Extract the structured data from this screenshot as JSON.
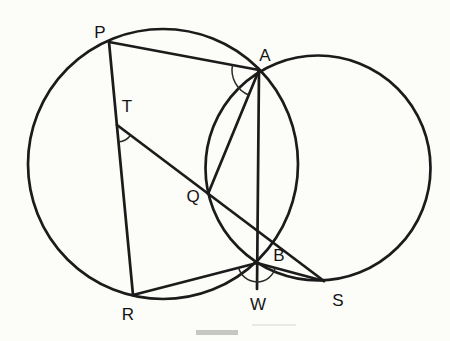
{
  "figure": {
    "points": {
      "P": "P",
      "A": "A",
      "T": "T",
      "Q": "Q",
      "B": "B",
      "R": "R",
      "W": "W",
      "S": "S"
    },
    "circles": [
      "left-circle-through-P-A-B-R",
      "right-circle-through-A-Q-B-S"
    ],
    "segments": [
      "P-A",
      "P-R (T on it)",
      "A-Q",
      "A-B-W",
      "T-Q-S",
      "R-B",
      "B-S"
    ],
    "angle_marks": [
      "at T between TR and TQ",
      "at A between AP and AQ",
      "at B between BR and BS across BW"
    ],
    "colors": {
      "line": "#1b1b1b",
      "label": "#141414",
      "background": "#fcfcf9",
      "caption_remnant": "#9a9a9a"
    }
  }
}
